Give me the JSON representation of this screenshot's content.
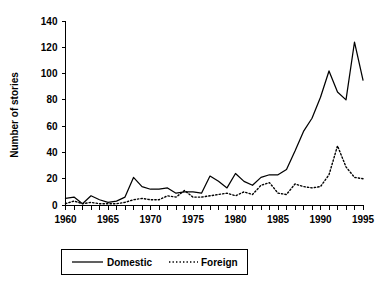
{
  "chart_data": {
    "type": "line",
    "title": "",
    "xlabel": "",
    "ylabel": "Number of stories",
    "xlim": [
      1960,
      1995
    ],
    "ylim": [
      0,
      140
    ],
    "ytick_step": 20,
    "yticks": [
      0,
      20,
      40,
      60,
      80,
      100,
      120,
      140
    ],
    "ytick_labels": [
      "0",
      "20",
      "40",
      "60",
      "80",
      "100",
      "120",
      "140"
    ],
    "xticks_minor_step": 1,
    "xtick_labels": [
      "1960",
      "1965",
      "1970",
      "1975",
      "1980",
      "1985",
      "1990",
      "1995"
    ],
    "xticks_labeled": [
      1960,
      1965,
      1970,
      1975,
      1980,
      1985,
      1990,
      1995
    ],
    "x": [
      1960,
      1961,
      1962,
      1963,
      1964,
      1965,
      1966,
      1967,
      1968,
      1969,
      1970,
      1971,
      1972,
      1973,
      1974,
      1975,
      1976,
      1977,
      1978,
      1979,
      1980,
      1981,
      1982,
      1983,
      1984,
      1985,
      1986,
      1987,
      1988,
      1989,
      1990,
      1991,
      1992,
      1993,
      1994,
      1995
    ],
    "grid": false,
    "legend_position": "below-center",
    "series": [
      {
        "name": "Domestic",
        "style": "solid",
        "color": "#000000",
        "values": [
          5,
          6,
          1,
          7,
          4,
          2,
          3,
          6,
          21,
          14,
          12,
          12,
          13,
          9,
          10,
          10,
          9,
          22,
          18,
          13,
          24,
          18,
          15,
          21,
          23,
          23,
          27,
          41,
          56,
          66,
          82,
          102,
          86,
          80,
          124,
          95
        ]
      },
      {
        "name": "Foreign",
        "style": "dotted",
        "color": "#000000",
        "values": [
          1,
          3,
          1,
          2,
          1,
          1,
          1,
          2,
          4,
          5,
          4,
          4,
          7,
          6,
          11,
          6,
          6,
          7,
          8,
          9,
          7,
          10,
          8,
          15,
          17,
          9,
          8,
          16,
          14,
          13,
          14,
          23,
          45,
          29,
          21,
          20
        ]
      }
    ]
  },
  "legend": {
    "items": [
      {
        "label": "Domestic",
        "style": "solid"
      },
      {
        "label": "Foreign",
        "style": "dotted"
      }
    ]
  }
}
